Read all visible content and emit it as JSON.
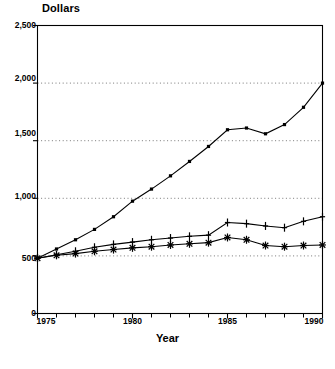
{
  "chart_data": {
    "type": "line",
    "title": "",
    "ylabel": "Dollars",
    "xlabel": "Year",
    "ylim": [
      0,
      2500
    ],
    "xlim": [
      1975,
      1990
    ],
    "ytick_labels": [
      "0",
      "500",
      "1,000",
      "1,500",
      "2,000",
      "2,500"
    ],
    "ytick_values": [
      0,
      500,
      1000,
      1500,
      2000,
      2500
    ],
    "xtick_labels": [
      "1975",
      "1980",
      "1985",
      "1990"
    ],
    "xtick_values": [
      1975,
      1980,
      1985,
      1990
    ],
    "xtick_minor_values": [
      1976,
      1977,
      1978,
      1979,
      1981,
      1982,
      1983,
      1984,
      1986,
      1987,
      1988,
      1989
    ],
    "grid": "horizontal dotted at 500, 1000, 1500, 2000",
    "legend": "none",
    "x": [
      1975,
      1976,
      1977,
      1978,
      1979,
      1980,
      1981,
      1982,
      1983,
      1984,
      1985,
      1986,
      1987,
      1988,
      1989,
      1990
    ],
    "series": [
      {
        "name": "series-1",
        "marker": "filled-square",
        "values": [
          480,
          560,
          640,
          730,
          840,
          975,
          1080,
          1195,
          1320,
          1450,
          1595,
          1610,
          1560,
          1640,
          1790,
          2000
        ]
      },
      {
        "name": "series-2",
        "marker": "plus",
        "values": [
          480,
          510,
          540,
          575,
          600,
          620,
          640,
          655,
          670,
          680,
          790,
          780,
          760,
          745,
          800,
          840
        ]
      },
      {
        "name": "series-3",
        "marker": "asterisk",
        "values": [
          480,
          505,
          520,
          540,
          555,
          570,
          580,
          595,
          605,
          615,
          660,
          640,
          590,
          580,
          590,
          595
        ]
      }
    ]
  },
  "labels": {
    "y_axis_title": "Dollars",
    "x_axis_title": "Year",
    "source_note": ""
  }
}
